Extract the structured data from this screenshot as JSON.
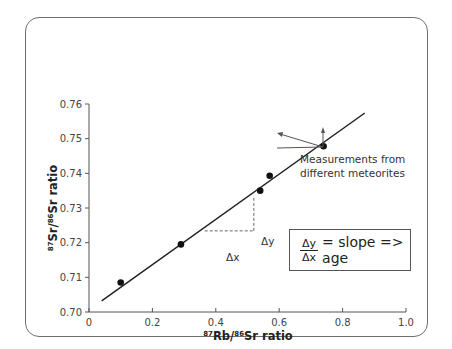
{
  "chart_data": {
    "type": "scatter",
    "title": "",
    "xlabel": "87Rb/86Sr ratio",
    "ylabel": "87Sr/86Sr ratio",
    "xlim": [
      0,
      1.0
    ],
    "ylim": [
      0.7,
      0.76
    ],
    "x_ticks": [
      "0",
      "0.2",
      "0.4",
      "0.6",
      "0.8",
      "1.0"
    ],
    "y_ticks": [
      "0.70",
      "0.71",
      "0.72",
      "0.73",
      "0.74",
      "0.75",
      "0.76"
    ],
    "grid": false,
    "legend": null,
    "series": [
      {
        "name": "Measurements from different meteorites",
        "type": "scatter",
        "points": [
          {
            "x": 0.1,
            "y": 0.7085
          },
          {
            "x": 0.29,
            "y": 0.7195
          },
          {
            "x": 0.54,
            "y": 0.735
          },
          {
            "x": 0.57,
            "y": 0.7393
          },
          {
            "x": 0.74,
            "y": 0.7478
          }
        ]
      },
      {
        "name": "Isochron fit line",
        "type": "line",
        "points": [
          {
            "x": 0.04,
            "y": 0.7032
          },
          {
            "x": 0.87,
            "y": 0.7574
          }
        ]
      }
    ],
    "annotations": [
      {
        "text": "Δx",
        "type": "dashed-horizontal",
        "from": {
          "x": 0.365,
          "y": 0.7234
        },
        "to": {
          "x": 0.52,
          "y": 0.7234
        }
      },
      {
        "text": "Δy",
        "type": "dashed-vertical",
        "from": {
          "x": 0.52,
          "y": 0.7234
        },
        "to": {
          "x": 0.52,
          "y": 0.7333
        }
      },
      {
        "text": "Measurements from different meteorites",
        "type": "arrows",
        "targets": [
          {
            "x": 0.575,
            "y": 0.7375
          },
          {
            "x": 0.74,
            "y": 0.7468
          }
        ]
      },
      {
        "text": "Δy / Δx = slope => age",
        "type": "boxed-formula"
      }
    ]
  },
  "labels": {
    "x_axis": {
      "sup1": "87",
      "main1": "Rb/",
      "sup2": "86",
      "main2": "Sr ratio"
    },
    "y_axis": {
      "sup1": "87",
      "main1": "Sr/",
      "sup2": "86",
      "main2": "Sr ratio"
    },
    "delta_x": "Δx",
    "delta_y": "Δy",
    "callout_line1": "Measurements from",
    "callout_line2": "different meteorites",
    "formula_num": "Δy",
    "formula_den": "Δx",
    "formula_rhs": "= slope => age"
  }
}
